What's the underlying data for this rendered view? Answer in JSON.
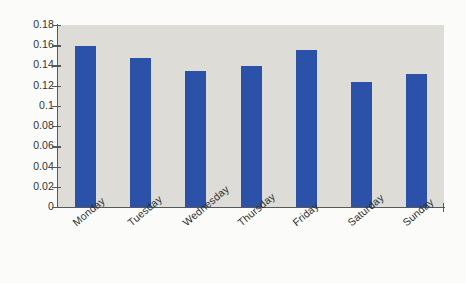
{
  "chart_data": {
    "type": "bar",
    "title": "",
    "subtitle": "",
    "xlabel": "",
    "ylabel": "",
    "categories": [
      "Monday",
      "Tuesday",
      "Wednesday",
      "Thursday",
      "Friday",
      "Saturday",
      "Sunday"
    ],
    "values": [
      0.159,
      0.147,
      0.135,
      0.139,
      0.155,
      0.124,
      0.132
    ],
    "series": [
      {
        "name": "",
        "values": [
          0.159,
          0.147,
          0.135,
          0.139,
          0.155,
          0.124,
          0.132
        ]
      }
    ],
    "ylim": [
      0,
      0.18
    ],
    "xlim_categories": 7,
    "y_ticks": [
      0,
      0.02,
      0.04,
      0.06,
      0.08,
      0.1,
      0.12,
      0.14,
      0.16,
      0.18
    ],
    "y_tick_labels": [
      "0",
      "0.02",
      "0.04",
      "0.06",
      "0.08",
      "0.1",
      "0.12",
      "0.14",
      "0.16",
      "0.18"
    ],
    "grid": false,
    "legend": null,
    "legend_position": "none",
    "annotations": [],
    "colors": {
      "bar": "#2b52a8",
      "plot_background": "#dedcd6",
      "figure_background": "#fbfbfa",
      "axis": "#55595c",
      "tick_label": "#2f3336",
      "category_label": "#2b2f33"
    },
    "x_tick_label_rotation_degrees": -40
  }
}
